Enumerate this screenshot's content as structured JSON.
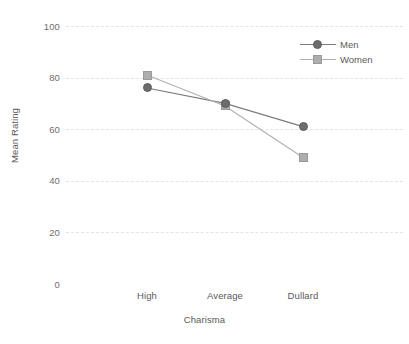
{
  "chart_data": {
    "type": "line",
    "title": "",
    "xlabel": "Charisma",
    "ylabel": "Mean Rating",
    "categories": [
      "High",
      "Average",
      "Dullard"
    ],
    "series": [
      {
        "name": "Men",
        "values": [
          76,
          70,
          61
        ],
        "marker": "circle",
        "color": "#6d6d6d"
      },
      {
        "name": "Women",
        "values": [
          81,
          69,
          49
        ],
        "marker": "square",
        "color": "#adadad"
      }
    ],
    "yticks": [
      0,
      20,
      40,
      60,
      80,
      100
    ],
    "ylim": [
      0,
      100
    ],
    "grid": true,
    "grid_style": "dashed-horizontal",
    "legend_position": "top-right",
    "background_color": "#ffffff"
  },
  "axes": {
    "y_title": "Mean Rating",
    "x_title": "Charisma",
    "y_tick_labels": [
      "100",
      "80",
      "60",
      "40",
      "20",
      "0"
    ],
    "x_tick_labels": [
      "High",
      "Average",
      "Dullard"
    ]
  },
  "legend": {
    "entries": [
      {
        "label": "Men",
        "marker_icon": "filled-circle-marker"
      },
      {
        "label": "Women",
        "marker_icon": "filled-square-marker"
      }
    ]
  }
}
